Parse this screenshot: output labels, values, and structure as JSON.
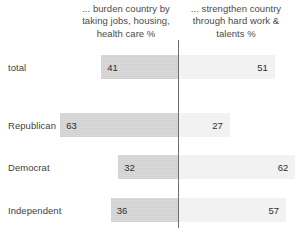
{
  "chart_data": {
    "type": "bar",
    "subtype": "diverging-stacked-bar",
    "title": "",
    "xlabel": "",
    "ylabel": "",
    "categories": [
      "total",
      "Republican",
      "Democrat",
      "Independent"
    ],
    "series": [
      {
        "name": "... burden country by taking jobs, housing, health care %",
        "side": "left",
        "values": [
          41,
          63,
          32,
          36
        ],
        "color": "#d9d9d9"
      },
      {
        "name": "... strengthen country through hard work & talents %",
        "side": "right",
        "values": [
          51,
          27,
          62,
          57
        ],
        "color": "#f2f2f2"
      }
    ],
    "legend_position": "top",
    "grid": false,
    "axis_line_color": "#6e6e6e"
  },
  "headers": {
    "left": "... burden country by taking jobs, housing, health care %",
    "right": "... strengthen country through hard work & talents %"
  },
  "rows": [
    {
      "label": "total",
      "left_value": "41",
      "right_value": "51",
      "left_pct": 41,
      "right_pct": 51
    },
    {
      "label": "Republican",
      "left_value": "63",
      "right_value": "27",
      "left_pct": 63,
      "right_pct": 27
    },
    {
      "label": "Democrat",
      "left_value": "32",
      "right_value": "62",
      "left_pct": 32,
      "right_pct": 62
    },
    {
      "label": "Independent",
      "left_value": "36",
      "right_value": "57",
      "left_pct": 36,
      "right_pct": 57
    }
  ],
  "layout": {
    "divider_x": 178,
    "row_tops": [
      55,
      113,
      155,
      198
    ],
    "bar_height": 24,
    "px_per_unit": 1.87
  }
}
